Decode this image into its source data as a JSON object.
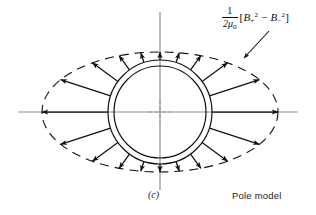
{
  "figure": {
    "panel_label": "(c)",
    "model_label": "Pole model",
    "formula": {
      "numerator": "1",
      "denominator_mu": "2μ",
      "denominator_sub": "0",
      "open_bracket": "[",
      "term1_symbol": "B",
      "term1_sub": "+",
      "term1_sup": "2",
      "minus": "−",
      "term2_symbol": "B",
      "term2_sub": "−",
      "term2_sup": "2",
      "close_bracket": "]",
      "plain": "1/(2μ0) [B+^2 − B-^2]"
    }
  },
  "geometry": {
    "center": {
      "x": 160,
      "y": 112
    },
    "inner_circle_radius": 46,
    "outer_circle_radius": 52,
    "ellipse_semi_major_a": 118,
    "ellipse_semi_minor_b": 60,
    "horizontal_axis": {
      "x1": 18,
      "x2": 298,
      "y": 112
    },
    "vertical_axis": {
      "x": 160,
      "y1": 12,
      "y2": 190
    },
    "arrow_count": 20,
    "leader_line": {
      "x1": 268,
      "y1": 30,
      "x2": 243,
      "y2": 57
    }
  },
  "colors": {
    "ink": "#111111",
    "axis": "#8a8a8a",
    "background": "#ffffff"
  },
  "arrows": [
    {
      "angle_deg": 0
    },
    {
      "angle_deg": 18
    },
    {
      "angle_deg": 36
    },
    {
      "angle_deg": 54
    },
    {
      "angle_deg": 72
    },
    {
      "angle_deg": 90
    },
    {
      "angle_deg": 108
    },
    {
      "angle_deg": 126
    },
    {
      "angle_deg": 144
    },
    {
      "angle_deg": 162
    },
    {
      "angle_deg": 180
    },
    {
      "angle_deg": 198
    },
    {
      "angle_deg": 216
    },
    {
      "angle_deg": 234
    },
    {
      "angle_deg": 252
    },
    {
      "angle_deg": 270
    },
    {
      "angle_deg": 288
    },
    {
      "angle_deg": 306
    },
    {
      "angle_deg": 324
    },
    {
      "angle_deg": 342
    }
  ]
}
